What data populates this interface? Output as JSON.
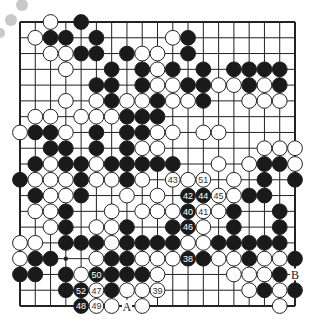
{
  "diagram": {
    "type": "go-board",
    "size": 19,
    "colors": {
      "black": "#1a1a1a",
      "white": "#ffffff",
      "line": "#222222",
      "deco": "#c8c8c8"
    },
    "labels": [
      {
        "text": "A",
        "col": 7,
        "row": 18
      },
      {
        "text": "B",
        "col": 18,
        "row": 16
      }
    ],
    "numbered_moves": [
      {
        "n": "38",
        "color": "B",
        "col": 11,
        "row": 15
      },
      {
        "n": "39",
        "color": "W",
        "col": 9,
        "row": 17
      },
      {
        "n": "40",
        "color": "B",
        "col": 11,
        "row": 12
      },
      {
        "n": "41",
        "color": "W",
        "col": 12,
        "row": 12
      },
      {
        "n": "42",
        "color": "B",
        "col": 11,
        "row": 11
      },
      {
        "n": "43",
        "color": "W",
        "col": 10,
        "row": 10
      },
      {
        "n": "44",
        "color": "B",
        "col": 12,
        "row": 11
      },
      {
        "n": "45",
        "color": "W",
        "col": 13,
        "row": 11
      },
      {
        "n": "46",
        "color": "B",
        "col": 11,
        "row": 13
      },
      {
        "n": "47",
        "color": "W",
        "col": 5,
        "row": 17
      },
      {
        "n": "48",
        "color": "B",
        "col": 4,
        "row": 18
      },
      {
        "n": "49",
        "color": "W",
        "col": 5,
        "row": 18
      },
      {
        "n": "50",
        "color": "B",
        "col": 5,
        "row": 16
      },
      {
        "n": "51",
        "color": "W",
        "col": 12,
        "row": 10
      },
      {
        "n": "52",
        "color": "B",
        "col": 4,
        "row": 17
      }
    ],
    "rows": [
      {
        "row": 0,
        "black": [
          4
        ],
        "white": [
          2
        ]
      },
      {
        "row": 1,
        "black": [
          2,
          3,
          5,
          11
        ],
        "white": [
          1,
          10
        ]
      },
      {
        "row": 2,
        "black": [
          4,
          5,
          7,
          11
        ],
        "white": [
          2,
          3,
          8,
          9
        ]
      },
      {
        "row": 3,
        "black": [
          6,
          8,
          10,
          12,
          14,
          15,
          16,
          17
        ],
        "white": [
          3,
          9
        ]
      },
      {
        "row": 4,
        "black": [
          5,
          6,
          8,
          11,
          12,
          15,
          17
        ],
        "white": [
          9,
          10,
          13,
          14,
          16
        ]
      },
      {
        "row": 5,
        "black": [
          6,
          9,
          12
        ],
        "white": [
          3,
          5,
          7,
          8,
          10,
          11,
          15,
          16,
          17
        ]
      },
      {
        "row": 6,
        "black": [
          7,
          8,
          9
        ],
        "white": [
          1,
          2,
          4,
          5,
          6
        ]
      },
      {
        "row": 7,
        "black": [
          1,
          2,
          5,
          7,
          8
        ],
        "white": [
          0,
          3,
          9,
          10,
          12,
          13
        ]
      },
      {
        "row": 8,
        "black": [
          2,
          3,
          5,
          7
        ],
        "white": [
          8,
          9,
          16,
          17,
          18
        ]
      },
      {
        "row": 9,
        "black": [
          1,
          3,
          4,
          6,
          7,
          8,
          9,
          10,
          16,
          17
        ],
        "white": [
          2,
          5,
          13,
          15,
          18
        ]
      },
      {
        "row": 10,
        "black": [
          0,
          4,
          7,
          16,
          18
        ],
        "white": [
          1,
          2,
          3,
          5,
          6,
          8,
          11,
          14
        ]
      },
      {
        "row": 11,
        "black": [
          1,
          4,
          15,
          16
        ],
        "white": [
          2,
          3,
          7,
          9,
          14
        ]
      },
      {
        "row": 12,
        "black": [
          3,
          14,
          17
        ],
        "white": [
          1,
          2,
          6,
          8,
          9,
          10,
          13
        ]
      },
      {
        "row": 13,
        "black": [
          3,
          7,
          10,
          14,
          17
        ],
        "white": [
          2,
          5,
          6,
          12
        ]
      },
      {
        "row": 14,
        "black": [
          3,
          4,
          5,
          7,
          8,
          9,
          10,
          13,
          14,
          15,
          16,
          17
        ],
        "white": [
          0,
          1,
          6,
          11,
          12
        ]
      },
      {
        "row": 15,
        "black": [
          1,
          2,
          6,
          7,
          12,
          15,
          18
        ],
        "white": [
          0,
          5,
          8,
          9,
          10,
          13,
          14,
          16,
          17
        ]
      },
      {
        "row": 16,
        "black": [
          0,
          1,
          3,
          6,
          7,
          8,
          17
        ],
        "white": [
          4,
          9,
          14,
          15,
          16
        ]
      },
      {
        "row": 17,
        "black": [
          3,
          6,
          16,
          18
        ],
        "white": [
          7,
          8,
          15,
          17
        ]
      },
      {
        "row": 18,
        "black": [],
        "white": [
          6,
          8,
          17
        ]
      }
    ],
    "star_points": [
      [
        3,
        3
      ],
      [
        3,
        9
      ],
      [
        3,
        15
      ],
      [
        9,
        3
      ],
      [
        9,
        9
      ],
      [
        9,
        15
      ],
      [
        15,
        3
      ],
      [
        15,
        9
      ],
      [
        15,
        15
      ]
    ]
  }
}
